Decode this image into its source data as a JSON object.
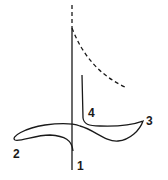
{
  "diagram": {
    "type": "hysteresis-loop-sketch",
    "stroke_color": "#1a1a1a",
    "labels": [
      {
        "id": "1",
        "text": "1",
        "x": 77,
        "y": 160
      },
      {
        "id": "2",
        "text": "2",
        "x": 13,
        "y": 148
      },
      {
        "id": "3",
        "text": "3",
        "x": 146,
        "y": 115
      },
      {
        "id": "4",
        "text": "4",
        "x": 88,
        "y": 107
      }
    ],
    "axis": {
      "x": 72,
      "dashed_top": [
        5,
        28
      ],
      "solid": [
        28,
        170
      ]
    },
    "dashed_curve": "from axis top sweeping down-right to (125,87)",
    "loop_path": "1 -> 2 -> 3 -> 4"
  }
}
